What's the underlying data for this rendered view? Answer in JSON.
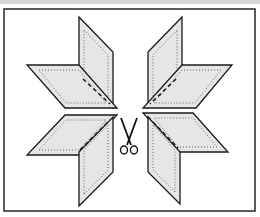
{
  "figure": {
    "colors": {
      "patch_fill": "#e6e6e6",
      "outline": "#1a1a1a",
      "frame": "#333333",
      "background": "#ffffff"
    },
    "icons": [
      "scissors-icon"
    ]
  }
}
